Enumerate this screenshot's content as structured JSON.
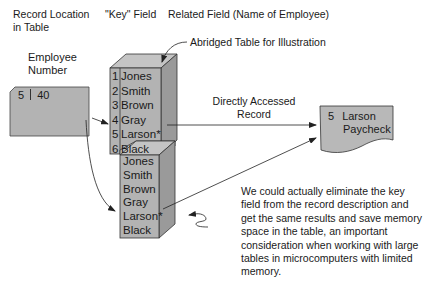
{
  "headers": {
    "record_location": [
      "Record Location",
      "in Table"
    ],
    "key_field": "\"Key\" Field",
    "related_field": "Related Field (Name of Employee)"
  },
  "employee_number": {
    "label": [
      "Employee",
      "Number"
    ],
    "location": "5",
    "value": "40"
  },
  "abridged_label": "Abridged Table for Illustration",
  "table_with_key": {
    "rows": [
      {
        "num": "1",
        "name": "Jones"
      },
      {
        "num": "2",
        "name": "Smith"
      },
      {
        "num": "3",
        "name": "Brown"
      },
      {
        "num": "4",
        "name": "Gray"
      },
      {
        "num": "5",
        "name": "Larson*"
      },
      {
        "num": "6",
        "name": "Black"
      }
    ]
  },
  "table_without_key": {
    "rows": [
      "Jones",
      "Smith",
      "Brown",
      "Gray",
      "Larson*",
      "Black"
    ]
  },
  "directly_accessed_label": [
    "Directly Accessed",
    "Record"
  ],
  "paycheck_doc": {
    "num": "5",
    "line1": "Larson",
    "line2": "Paycheck"
  },
  "note": [
    "We could actually eliminate the key",
    "field from the record description and",
    "get the same results and save memory",
    "space in the table, an important",
    "consideration when working with large",
    "tables in microcomputers with limited",
    "memory."
  ],
  "colors": {
    "box_fill": "#b3b3b3",
    "box_side": "#9a9a9a",
    "box_top": "#c4c4c4",
    "line": "#222222"
  }
}
